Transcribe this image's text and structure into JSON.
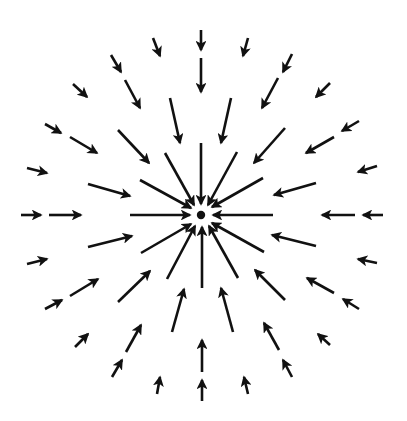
{
  "diagram": {
    "kind": "radial vector field converging on a point",
    "background_color": "#ffffff",
    "arrow_color": "#111111",
    "stroke_width": 2.6,
    "center_point": {
      "x": 201,
      "y": 215,
      "radius": 4.2,
      "color": "#111111"
    },
    "arrows": [
      {
        "x1": 201,
        "y1": 30,
        "x2": 201,
        "y2": 50
      },
      {
        "x1": 201,
        "y1": 58,
        "x2": 201,
        "y2": 92
      },
      {
        "x1": 201,
        "y1": 143,
        "x2": 201,
        "y2": 204
      },
      {
        "x1": 153,
        "y1": 38,
        "x2": 160,
        "y2": 56
      },
      {
        "x1": 170,
        "y1": 98,
        "x2": 180,
        "y2": 143
      },
      {
        "x1": 248,
        "y1": 38,
        "x2": 243,
        "y2": 56
      },
      {
        "x1": 231,
        "y1": 98,
        "x2": 221,
        "y2": 143
      },
      {
        "x1": 111,
        "y1": 55,
        "x2": 121,
        "y2": 72
      },
      {
        "x1": 125,
        "y1": 80,
        "x2": 140,
        "y2": 108
      },
      {
        "x1": 165,
        "y1": 153,
        "x2": 194,
        "y2": 205
      },
      {
        "x1": 292,
        "y1": 54,
        "x2": 283,
        "y2": 72
      },
      {
        "x1": 278,
        "y1": 78,
        "x2": 262,
        "y2": 108
      },
      {
        "x1": 237,
        "y1": 152,
        "x2": 208,
        "y2": 205
      },
      {
        "x1": 73,
        "y1": 84,
        "x2": 87,
        "y2": 97
      },
      {
        "x1": 118,
        "y1": 130,
        "x2": 149,
        "y2": 163
      },
      {
        "x1": 330,
        "y1": 83,
        "x2": 316,
        "y2": 97
      },
      {
        "x1": 285,
        "y1": 128,
        "x2": 254,
        "y2": 163
      },
      {
        "x1": 45,
        "y1": 124,
        "x2": 61,
        "y2": 133
      },
      {
        "x1": 70,
        "y1": 137,
        "x2": 97,
        "y2": 153
      },
      {
        "x1": 140,
        "y1": 180,
        "x2": 191,
        "y2": 208
      },
      {
        "x1": 359,
        "y1": 121,
        "x2": 342,
        "y2": 131
      },
      {
        "x1": 334,
        "y1": 137,
        "x2": 306,
        "y2": 153
      },
      {
        "x1": 263,
        "y1": 178,
        "x2": 212,
        "y2": 207
      },
      {
        "x1": 27,
        "y1": 168,
        "x2": 47,
        "y2": 173
      },
      {
        "x1": 88,
        "y1": 184,
        "x2": 130,
        "y2": 196
      },
      {
        "x1": 377,
        "y1": 166,
        "x2": 358,
        "y2": 172
      },
      {
        "x1": 316,
        "y1": 183,
        "x2": 274,
        "y2": 195
      },
      {
        "x1": 21,
        "y1": 215,
        "x2": 41,
        "y2": 215
      },
      {
        "x1": 49,
        "y1": 215,
        "x2": 81,
        "y2": 215
      },
      {
        "x1": 130,
        "y1": 215,
        "x2": 190,
        "y2": 215
      },
      {
        "x1": 383,
        "y1": 215,
        "x2": 363,
        "y2": 215
      },
      {
        "x1": 355,
        "y1": 215,
        "x2": 322,
        "y2": 215
      },
      {
        "x1": 273,
        "y1": 215,
        "x2": 213,
        "y2": 215
      },
      {
        "x1": 27,
        "y1": 264,
        "x2": 47,
        "y2": 259
      },
      {
        "x1": 88,
        "y1": 247,
        "x2": 132,
        "y2": 236
      },
      {
        "x1": 377,
        "y1": 263,
        "x2": 358,
        "y2": 259
      },
      {
        "x1": 316,
        "y1": 246,
        "x2": 272,
        "y2": 235
      },
      {
        "x1": 45,
        "y1": 309,
        "x2": 62,
        "y2": 300
      },
      {
        "x1": 70,
        "y1": 296,
        "x2": 98,
        "y2": 279
      },
      {
        "x1": 141,
        "y1": 253,
        "x2": 191,
        "y2": 224
      },
      {
        "x1": 359,
        "y1": 309,
        "x2": 343,
        "y2": 299
      },
      {
        "x1": 334,
        "y1": 293,
        "x2": 307,
        "y2": 278
      },
      {
        "x1": 264,
        "y1": 252,
        "x2": 212,
        "y2": 223
      },
      {
        "x1": 75,
        "y1": 347,
        "x2": 88,
        "y2": 334
      },
      {
        "x1": 118,
        "y1": 302,
        "x2": 150,
        "y2": 271
      },
      {
        "x1": 330,
        "y1": 345,
        "x2": 318,
        "y2": 334
      },
      {
        "x1": 285,
        "y1": 300,
        "x2": 255,
        "y2": 270
      },
      {
        "x1": 112,
        "y1": 377,
        "x2": 122,
        "y2": 360
      },
      {
        "x1": 126,
        "y1": 352,
        "x2": 141,
        "y2": 325
      },
      {
        "x1": 167,
        "y1": 279,
        "x2": 195,
        "y2": 226
      },
      {
        "x1": 292,
        "y1": 377,
        "x2": 283,
        "y2": 360
      },
      {
        "x1": 279,
        "y1": 350,
        "x2": 264,
        "y2": 323
      },
      {
        "x1": 238,
        "y1": 278,
        "x2": 209,
        "y2": 226
      },
      {
        "x1": 157,
        "y1": 394,
        "x2": 160,
        "y2": 377
      },
      {
        "x1": 172,
        "y1": 332,
        "x2": 184,
        "y2": 289
      },
      {
        "x1": 248,
        "y1": 394,
        "x2": 244,
        "y2": 377
      },
      {
        "x1": 233,
        "y1": 332,
        "x2": 221,
        "y2": 288
      },
      {
        "x1": 202,
        "y1": 401,
        "x2": 202,
        "y2": 380
      },
      {
        "x1": 202,
        "y1": 372,
        "x2": 202,
        "y2": 340
      },
      {
        "x1": 202,
        "y1": 288,
        "x2": 202,
        "y2": 227
      }
    ]
  }
}
